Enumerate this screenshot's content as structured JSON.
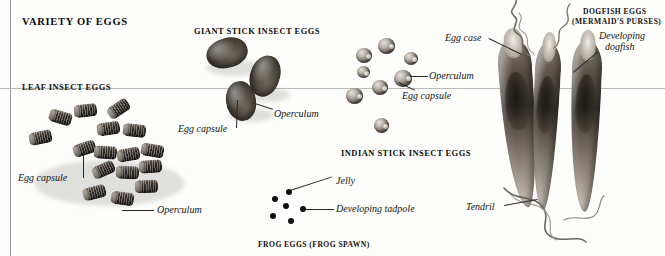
{
  "figure": {
    "title": "VARIETY OF EGGS",
    "background_color": "#fdfdfc",
    "rule_color": "#b9b9b9"
  },
  "sections": [
    {
      "id": "leaf-insect",
      "heading": "LEAF INSECT EGGS"
    },
    {
      "id": "giant-stick",
      "heading": "GIANT STICK INSECT EGGS"
    },
    {
      "id": "indian-stick",
      "heading": "INDIAN STICK INSECT EGGS"
    },
    {
      "id": "frog",
      "heading": "FROG EGGS (FROG SPAWN)"
    },
    {
      "id": "dogfish",
      "heading_line1": "DOGFISH EGGS",
      "heading_line2": "(MERMAID'S PURSES)"
    }
  ],
  "callouts": {
    "leaf_egg_capsule": "Egg capsule",
    "leaf_operculum": "Operculum",
    "giant_egg_capsule": "Egg capsule",
    "giant_operculum": "Operculum",
    "indian_operculum": "Operculum",
    "indian_egg_capsule": "Egg capsule",
    "frog_jelly": "Jelly",
    "frog_tadpole": "Developing tadpole",
    "dogfish_egg_case": "Egg case",
    "dogfish_developing_line1": "Developing",
    "dogfish_developing_line2": "dogfish",
    "dogfish_tendril": "Tendril"
  },
  "specimens": {
    "leaf_insect_eggs_count": 16,
    "giant_stick_eggs_count": 3,
    "indian_stick_eggs_count": 8,
    "frog_spawn_dots_count": 6,
    "dogfish_purses_count": 2
  }
}
